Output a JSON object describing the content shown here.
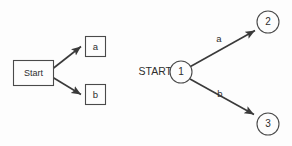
{
  "canvas": {
    "width": 292,
    "height": 146,
    "background": "#fdfdfd",
    "stroke_color": "#4a4a4a",
    "edge_color": "#3a3a3a",
    "text_color": "#2e2e2e"
  },
  "left_diagram": {
    "name": "box-and-arrow-diagram",
    "start_box": {
      "label": "Start",
      "shape": "rectangle",
      "x": 13,
      "y": 60,
      "width": 40,
      "height": 25
    },
    "target_boxes": [
      {
        "label": "a",
        "shape": "rectangle",
        "x": 85,
        "y": 36,
        "width": 20,
        "height": 20
      },
      {
        "label": "b",
        "shape": "rectangle",
        "x": 85,
        "y": 84,
        "width": 20,
        "height": 20
      }
    ],
    "arrows": [
      {
        "name": "arrow-start-to-a",
        "from": "Start",
        "to": "a",
        "x1": 53,
        "y1": 68,
        "x2": 83,
        "y2": 45
      },
      {
        "name": "arrow-start-to-b",
        "from": "Start",
        "to": "b",
        "x1": 53,
        "y1": 78,
        "x2": 83,
        "y2": 96
      }
    ]
  },
  "right_diagram": {
    "name": "state-transition-diagram",
    "start_label": "START",
    "start_label_x": 172,
    "start_label_y": 72,
    "states": [
      {
        "label": "1",
        "shape": "circle",
        "cx": 181,
        "cy": 72,
        "r": 11
      },
      {
        "label": "2",
        "shape": "circle",
        "cx": 268,
        "cy": 22,
        "r": 11
      },
      {
        "label": "3",
        "shape": "circle",
        "cx": 268,
        "cy": 124,
        "r": 11
      }
    ],
    "transitions": [
      {
        "name": "transition-1-to-2",
        "label": "a",
        "from": "1",
        "to": "2",
        "x1": 191,
        "y1": 66,
        "x2": 257,
        "y2": 29,
        "label_x": 219,
        "label_y": 39
      },
      {
        "name": "transition-1-to-3",
        "label": "b",
        "from": "1",
        "to": "3",
        "x1": 190,
        "y1": 79,
        "x2": 256,
        "y2": 116,
        "label_x": 220,
        "label_y": 94
      }
    ]
  }
}
